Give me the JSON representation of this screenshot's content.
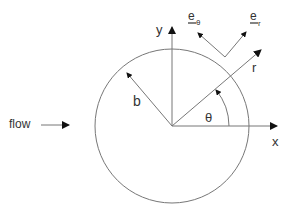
{
  "diagram": {
    "labels": {
      "flow": "flow",
      "x_axis": "x",
      "y_axis": "y",
      "radius": "b",
      "radial_coord": "r",
      "angle": "θ",
      "unit_vector_r": "e",
      "unit_vector_r_sub": "r",
      "unit_vector_theta": "e",
      "unit_vector_theta_sub": "θ"
    },
    "geometry": {
      "circle_center": [
        172,
        126
      ],
      "circle_radius": 77,
      "theta_deg": 40
    },
    "colors": {
      "line": "#777777",
      "text": "#333333",
      "arrowhead": "#111111"
    }
  }
}
